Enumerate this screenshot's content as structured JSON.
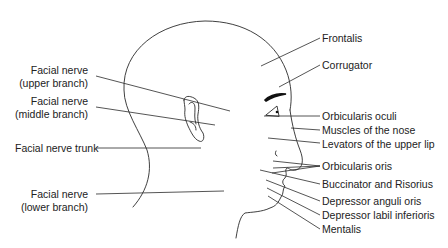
{
  "diagram": {
    "labels_left": [
      {
        "id": "facial-nerve-upper",
        "line1": "Facial nerve",
        "line2": "(upper branch)"
      },
      {
        "id": "facial-nerve-middle",
        "line1": "Facial nerve",
        "line2": "(middle branch)"
      },
      {
        "id": "facial-nerve-trunk",
        "line1": "Facial nerve trunk"
      },
      {
        "id": "facial-nerve-lower",
        "line1": "Facial nerve",
        "line2": "(lower branch)"
      }
    ],
    "labels_right": [
      {
        "id": "frontalis",
        "text": "Frontalis"
      },
      {
        "id": "corrugator",
        "text": "Corrugator"
      },
      {
        "id": "orbicularis-oculi",
        "text": "Orbicularis oculi"
      },
      {
        "id": "muscles-nose",
        "text": "Muscles of the nose"
      },
      {
        "id": "levators-upper-lip",
        "text": "Levators of the upper lip"
      },
      {
        "id": "orbicularis-oris",
        "text": "Orbicularis oris"
      },
      {
        "id": "buccinator-risorius",
        "text": "Buccinator and Risorius"
      },
      {
        "id": "depressor-anguli-oris",
        "text": "Depressor anguli oris"
      },
      {
        "id": "depressor-labii-inferioris",
        "text": "Depressor labil inferioris"
      },
      {
        "id": "mentalis",
        "text": "Mentalis"
      }
    ]
  }
}
